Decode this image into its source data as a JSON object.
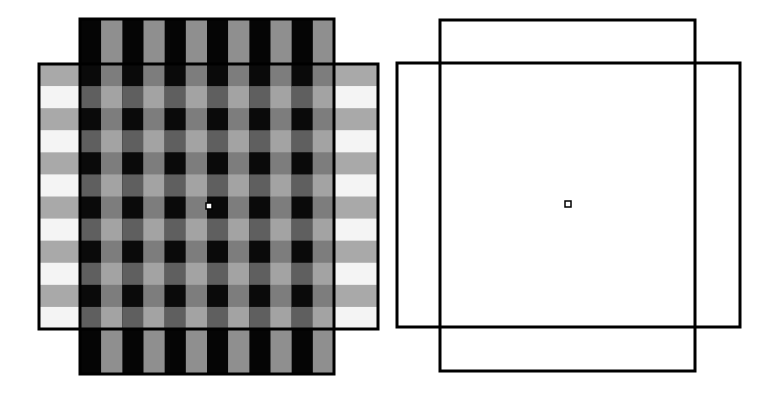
{
  "canvas": {
    "width": 776,
    "height": 396,
    "background": "#ffffff"
  },
  "colors": {
    "border": "#000000",
    "v_black": "#050505",
    "v_gray": "#8f8f8f",
    "h_gray": "#a9a9a9",
    "h_white": "#f4f4f4",
    "overlap_black_gray": "#0a0a0a",
    "overlap_black_white": "#5f5f5f",
    "overlap_gray_gray": "#7d7d7d",
    "overlap_gray_white": "#a3a3a3",
    "marker_fill": "#ffffff"
  },
  "left_figure": {
    "name": "striped-overlap-figure",
    "horizontal_rect": {
      "x": 39,
      "y": 64,
      "w": 339,
      "h": 265,
      "stripes": 12,
      "first": "gray"
    },
    "vertical_rect": {
      "x": 80,
      "y": 19,
      "w": 254,
      "h": 355,
      "stripes": 12,
      "first": "black"
    },
    "border_width": 3,
    "center_marker": {
      "x": 206,
      "y": 203,
      "size": 6
    }
  },
  "right_figure": {
    "name": "outline-overlap-figure",
    "vertical_rect": {
      "x": 440,
      "y": 20,
      "w": 255,
      "h": 351
    },
    "horizontal_rect": {
      "x": 397,
      "y": 63,
      "w": 343,
      "h": 264
    },
    "border_width": 3,
    "center_marker": {
      "x": 565,
      "y": 201,
      "size": 6
    }
  }
}
